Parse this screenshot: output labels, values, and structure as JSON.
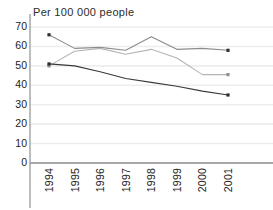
{
  "chart_data": {
    "type": "line",
    "title": "Per 100 000 people",
    "xlabel": "",
    "ylabel": "",
    "categories": [
      "1994",
      "1995",
      "1996",
      "1997",
      "1998",
      "1999",
      "2000",
      "2001"
    ],
    "x": [
      1994,
      1995,
      1996,
      1997,
      1998,
      1999,
      2000,
      2001
    ],
    "ylim": [
      0,
      70
    ],
    "yticks": [
      0,
      10,
      20,
      30,
      40,
      50,
      60,
      70
    ],
    "ytick_labels": [
      "0",
      "10",
      "20",
      "30",
      "40",
      "50",
      "60",
      "70"
    ],
    "grid": true,
    "grid_axis": "y",
    "legend": false,
    "legend_position": "none",
    "series": [
      {
        "name": "series-a",
        "color": "#8c8c8c",
        "marker": "square",
        "values": [
          66,
          59,
          59.5,
          58,
          65,
          58.5,
          59,
          58
        ]
      },
      {
        "name": "series-b",
        "color": "#b5b5b5",
        "marker": "square",
        "values": [
          50,
          57.5,
          59,
          56,
          58.5,
          54,
          45.5,
          45.5
        ]
      },
      {
        "name": "series-c",
        "color": "#3a3a3a",
        "marker": "square",
        "values": [
          51,
          50,
          47,
          43.5,
          41.5,
          39.5,
          37,
          35
        ]
      }
    ],
    "axis_color": "#9a9a9a",
    "gridline_color": "#ededed",
    "background": "#ffffff"
  }
}
